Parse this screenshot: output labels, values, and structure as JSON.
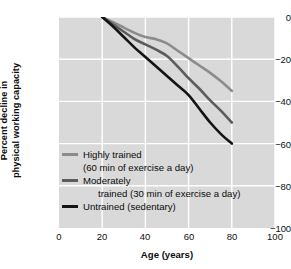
{
  "chart_data": {
    "type": "line",
    "title": "",
    "xlabel": "Age (years)",
    "ylabel": "Percent decline in physical working capacity",
    "ylabel_line1": "Percent decline in",
    "ylabel_line2": "physical working capacity",
    "xlim": [
      0,
      100
    ],
    "ylim": [
      -100,
      0
    ],
    "xticks": [
      0,
      20,
      40,
      60,
      80,
      100
    ],
    "yticks": [
      0,
      -20,
      -40,
      -60,
      -80,
      -100
    ],
    "xtick_labels": [
      "0",
      "20",
      "40",
      "60",
      "80",
      "100"
    ],
    "ytick_labels": [
      "0",
      "−20",
      "−40",
      "−60",
      "−80",
      "−100"
    ],
    "grid": true,
    "grid_color": "#ffffff",
    "plot_background": "#d9d9d9",
    "legend_position": "lower-left-inside",
    "series": [
      {
        "name": "Highly trained",
        "legend_line1": "Highly trained",
        "legend_line2": "(60 min of exercise a day)",
        "color": "#8c8c8c",
        "x": [
          20,
          25,
          30,
          35,
          40,
          45,
          50,
          55,
          60,
          65,
          70,
          75,
          80
        ],
        "values": [
          0,
          -2.5,
          -5,
          -7.5,
          -9.5,
          -10.5,
          -12.5,
          -16,
          -19.5,
          -23,
          -26.5,
          -30.5,
          -35
        ]
      },
      {
        "name": "Moderately trained",
        "legend_line1": "Moderately",
        "legend_line2": "trained (30 min of exercise a day)",
        "color": "#5c5c5c",
        "x": [
          20,
          25,
          30,
          35,
          40,
          45,
          50,
          55,
          60,
          65,
          70,
          75,
          80
        ],
        "values": [
          0,
          -3.5,
          -7,
          -10.5,
          -13,
          -15.5,
          -18.5,
          -23.5,
          -29,
          -34,
          -39.5,
          -44.5,
          -50
        ]
      },
      {
        "name": "Untrained (sedentary)",
        "legend_line1": "Untrained (sedentary)",
        "legend_line2": "",
        "color": "#141414",
        "x": [
          20,
          25,
          30,
          35,
          40,
          45,
          50,
          55,
          60,
          65,
          70,
          75,
          80
        ],
        "values": [
          0,
          -4.5,
          -9.5,
          -14.5,
          -19,
          -23.5,
          -28,
          -32.5,
          -37,
          -43.5,
          -50,
          -55.5,
          -60
        ]
      }
    ]
  }
}
